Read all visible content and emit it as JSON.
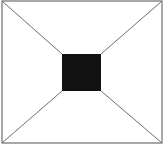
{
  "diagram": {
    "outer_box": {
      "x1": 2,
      "y1": 1,
      "x2": 162,
      "y2": 143,
      "stroke": "#6e6e6e"
    },
    "inner_square": {
      "x1": 62,
      "y1": 54,
      "x2": 101,
      "y2": 91,
      "fill": "#111111"
    },
    "line_color": "#6e6e6e",
    "background": "#ffffff"
  }
}
